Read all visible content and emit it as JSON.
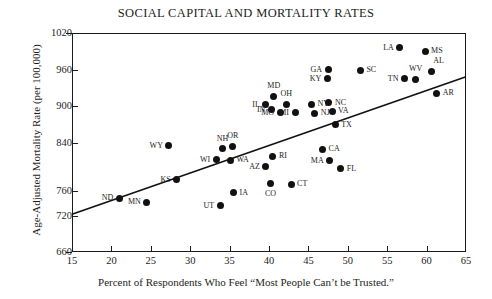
{
  "chart_data": {
    "type": "scatter",
    "title": "SOCIAL CAPITAL AND MORTALITY RATES",
    "xlabel": "Percent of Respondents Who Feel “Most People Can’t be Trusted.”",
    "ylabel": "Age-Adjusted Mortality Rate (per 100,000)",
    "xlim": [
      15,
      65
    ],
    "ylim": [
      660,
      1020
    ],
    "xticks": [
      15,
      20,
      25,
      30,
      35,
      40,
      45,
      50,
      55,
      60,
      65
    ],
    "yticks": [
      660,
      720,
      760,
      840,
      900,
      960,
      1020
    ],
    "grid": false,
    "legend": null,
    "marker": "filled-circle",
    "trendline": {
      "type": "linear-fit",
      "x_start": 15,
      "y_start": 722,
      "x_end": 65,
      "y_end": 948
    },
    "points": [
      {
        "label": "ND",
        "x": 21.0,
        "y": 748,
        "label_pos": "left"
      },
      {
        "label": "MN",
        "x": 24.5,
        "y": 742,
        "label_pos": "left"
      },
      {
        "label": "KS",
        "x": 28.3,
        "y": 779,
        "label_pos": "left"
      },
      {
        "label": "WY",
        "x": 27.3,
        "y": 835,
        "label_pos": "left"
      },
      {
        "label": "UT",
        "x": 33.8,
        "y": 736,
        "label_pos": "left"
      },
      {
        "label": "WI",
        "x": 33.3,
        "y": 812,
        "label_pos": "left"
      },
      {
        "label": "NH",
        "x": 34.1,
        "y": 830,
        "label_pos": "top"
      },
      {
        "label": "OR",
        "x": 35.4,
        "y": 834,
        "label_pos": "top"
      },
      {
        "label": "WA",
        "x": 35.1,
        "y": 811,
        "label_pos": "right"
      },
      {
        "label": "IA",
        "x": 35.5,
        "y": 757,
        "label_pos": "right"
      },
      {
        "label": "AZ",
        "x": 39.6,
        "y": 800,
        "label_pos": "left"
      },
      {
        "label": "RI",
        "x": 40.5,
        "y": 817,
        "label_pos": "right"
      },
      {
        "label": "CO",
        "x": 40.2,
        "y": 772,
        "label_pos": "bottom"
      },
      {
        "label": "CT",
        "x": 42.8,
        "y": 771,
        "label_pos": "right"
      },
      {
        "label": "IL",
        "x": 39.6,
        "y": 902,
        "label_pos": "left"
      },
      {
        "label": "MD",
        "x": 40.6,
        "y": 916,
        "label_pos": "top"
      },
      {
        "label": "IN",
        "x": 40.3,
        "y": 894,
        "label_pos": "left"
      },
      {
        "label": "MO",
        "x": 41.4,
        "y": 889,
        "label_pos": "left"
      },
      {
        "label": "OH",
        "x": 42.2,
        "y": 903,
        "label_pos": "top"
      },
      {
        "label": "MI",
        "x": 43.3,
        "y": 889,
        "label_pos": "left"
      },
      {
        "label": "NY",
        "x": 45.4,
        "y": 903,
        "label_pos": "right"
      },
      {
        "label": "NJ",
        "x": 45.8,
        "y": 888,
        "label_pos": "right"
      },
      {
        "label": "NC",
        "x": 47.6,
        "y": 905,
        "label_pos": "right"
      },
      {
        "label": "VA",
        "x": 48.0,
        "y": 891,
        "label_pos": "right"
      },
      {
        "label": "GA",
        "x": 47.5,
        "y": 960,
        "label_pos": "left"
      },
      {
        "label": "KY",
        "x": 47.4,
        "y": 945,
        "label_pos": "left"
      },
      {
        "label": "CA",
        "x": 46.8,
        "y": 829,
        "label_pos": "right"
      },
      {
        "label": "MA",
        "x": 47.7,
        "y": 810,
        "label_pos": "left"
      },
      {
        "label": "FL",
        "x": 49.1,
        "y": 797,
        "label_pos": "right"
      },
      {
        "label": "TX",
        "x": 48.4,
        "y": 869,
        "label_pos": "right"
      },
      {
        "label": "SC",
        "x": 51.6,
        "y": 959,
        "label_pos": "right"
      },
      {
        "label": "LA",
        "x": 56.6,
        "y": 996,
        "label_pos": "left"
      },
      {
        "label": "MS",
        "x": 59.8,
        "y": 990,
        "label_pos": "right"
      },
      {
        "label": "TN",
        "x": 57.2,
        "y": 945,
        "label_pos": "left"
      },
      {
        "label": "WV",
        "x": 58.6,
        "y": 944,
        "label_pos": "top"
      },
      {
        "label": "AL",
        "x": 60.6,
        "y": 957,
        "label_pos": "tr"
      },
      {
        "label": "AR",
        "x": 61.3,
        "y": 921,
        "label_pos": "right"
      }
    ]
  }
}
